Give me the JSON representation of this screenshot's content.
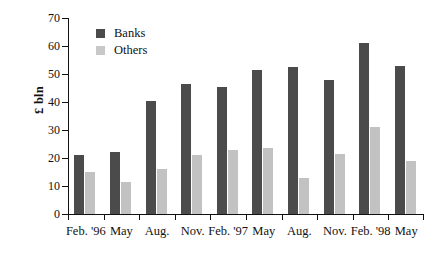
{
  "chart_data": {
    "type": "bar",
    "title": "",
    "xlabel": "",
    "ylabel": "£ bln",
    "ylim": [
      0,
      70
    ],
    "yticks": [
      0,
      10,
      20,
      30,
      40,
      50,
      60,
      70
    ],
    "ytick_labels": [
      "0",
      "10",
      "20",
      "30",
      "40",
      "50",
      "60",
      "70"
    ],
    "grid": false,
    "legend_position": "top-left-inside",
    "categories": [
      "Feb. '96",
      "May",
      "Aug.",
      "Nov.",
      "Feb. '97",
      "May",
      "Aug.",
      "Nov.",
      "Feb. '98",
      "May"
    ],
    "series": [
      {
        "name": "Banks",
        "color": "#4b4b4b",
        "values": [
          21,
          22,
          40.5,
          46.5,
          45.5,
          51.5,
          52.5,
          48,
          61,
          53
        ]
      },
      {
        "name": "Others",
        "color": "#c2c2c2",
        "values": [
          15,
          11.5,
          16,
          21,
          23,
          23.5,
          13,
          21.5,
          31,
          19
        ]
      }
    ]
  }
}
